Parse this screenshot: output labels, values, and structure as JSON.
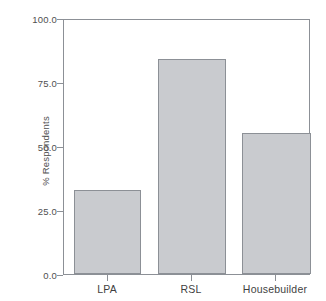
{
  "chart_data": {
    "type": "bar",
    "title": "",
    "subtitle": "",
    "xlabel": "",
    "ylabel": "% Respondents",
    "categories": [
      "LPA",
      "RSL",
      "Housebuilder"
    ],
    "values": [
      33,
      84,
      55
    ],
    "series": [
      {
        "name": "% Respondents",
        "values": [
          33,
          84,
          55
        ]
      }
    ],
    "ylim": [
      0.0,
      100.0
    ],
    "y_ticks": [
      0.0,
      25.0,
      50.0,
      75.0,
      100.0
    ],
    "y_tick_labels": [
      "0.0",
      "25.0",
      "50.0",
      "75.0",
      "100.0"
    ],
    "x_tick_labels": [
      "LPA",
      "RSL",
      "Housebuilder"
    ],
    "grid": false,
    "legend": false,
    "legend_position": "none",
    "annotations": [],
    "colors": {
      "bar_fill": "#c9cbcf",
      "bar_border": "#8c9096",
      "axis": "#8c9096",
      "text": "#4f4f4f",
      "background": "#ffffff"
    }
  }
}
